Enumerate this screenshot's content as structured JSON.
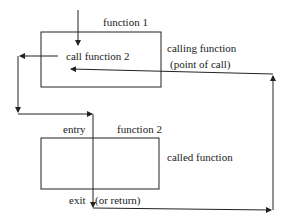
{
  "diagram": {
    "function1": {
      "title": "function 1",
      "inner_label": "call function 2",
      "side_label": "calling function",
      "side_sublabel": "(point of call)"
    },
    "function2": {
      "title": "function 2",
      "entry_label": "entry",
      "exit_label": "exit",
      "return_label": "(or return)",
      "side_label": "called function"
    }
  }
}
